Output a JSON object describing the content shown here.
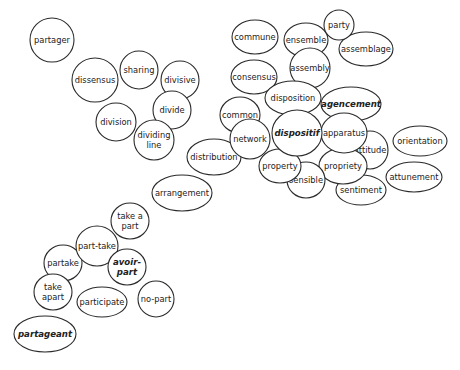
{
  "diagram": {
    "type": "word-bubble-cluster",
    "colors": {
      "stroke": "#2a2a2a",
      "fill": "#ffffff",
      "text": "#222222"
    },
    "nodes": [
      {
        "id": "partager",
        "lines": [
          "partager"
        ],
        "emphasis": false
      },
      {
        "id": "dissensus",
        "lines": [
          "dissensus"
        ],
        "emphasis": false
      },
      {
        "id": "sharing",
        "lines": [
          "sharing"
        ],
        "emphasis": false
      },
      {
        "id": "divisive",
        "lines": [
          "divisive"
        ],
        "emphasis": false
      },
      {
        "id": "divide",
        "lines": [
          "divide"
        ],
        "emphasis": false
      },
      {
        "id": "division",
        "lines": [
          "division"
        ],
        "emphasis": false
      },
      {
        "id": "dividing-line",
        "lines": [
          "dividing",
          "line"
        ],
        "emphasis": false
      },
      {
        "id": "commune",
        "lines": [
          "commune"
        ],
        "emphasis": false
      },
      {
        "id": "consensus",
        "lines": [
          "consensus"
        ],
        "emphasis": false
      },
      {
        "id": "distribution",
        "lines": [
          "distribution"
        ],
        "emphasis": false
      },
      {
        "id": "common",
        "lines": [
          "common"
        ],
        "emphasis": false
      },
      {
        "id": "network",
        "lines": [
          "network"
        ],
        "emphasis": false
      },
      {
        "id": "assemblage",
        "lines": [
          "assemblage"
        ],
        "emphasis": false
      },
      {
        "id": "ensemble",
        "lines": [
          "ensemble"
        ],
        "emphasis": false
      },
      {
        "id": "party",
        "lines": [
          "party"
        ],
        "emphasis": false
      },
      {
        "id": "assembly",
        "lines": [
          "assembly"
        ],
        "emphasis": false
      },
      {
        "id": "agencement",
        "lines": [
          "agencement"
        ],
        "emphasis": true
      },
      {
        "id": "disposition",
        "lines": [
          "disposition"
        ],
        "emphasis": false
      },
      {
        "id": "orientation",
        "lines": [
          "orientation"
        ],
        "emphasis": false
      },
      {
        "id": "attunement",
        "lines": [
          "attunement"
        ],
        "emphasis": false
      },
      {
        "id": "attitude",
        "lines": [
          "attitude"
        ],
        "emphasis": false
      },
      {
        "id": "sentiment",
        "lines": [
          "sentiment"
        ],
        "emphasis": false
      },
      {
        "id": "propriety",
        "lines": [
          "propriety"
        ],
        "emphasis": false
      },
      {
        "id": "apparatus",
        "lines": [
          "apparatus"
        ],
        "emphasis": false
      },
      {
        "id": "sensible",
        "lines": [
          "sensible"
        ],
        "emphasis": false
      },
      {
        "id": "property",
        "lines": [
          "property"
        ],
        "emphasis": false
      },
      {
        "id": "dispositif",
        "lines": [
          "dispositif"
        ],
        "emphasis": true
      },
      {
        "id": "arrangement",
        "lines": [
          "arrangement"
        ],
        "emphasis": false
      },
      {
        "id": "take-a-part",
        "lines": [
          "take a",
          "part"
        ],
        "emphasis": false
      },
      {
        "id": "partake",
        "lines": [
          "partake"
        ],
        "emphasis": false
      },
      {
        "id": "part-take",
        "lines": [
          "part-take"
        ],
        "emphasis": false
      },
      {
        "id": "avoir-part",
        "lines": [
          "avoir-",
          "part"
        ],
        "emphasis": true
      },
      {
        "id": "take-apart",
        "lines": [
          "take",
          "apart"
        ],
        "emphasis": false
      },
      {
        "id": "participate",
        "lines": [
          "participate"
        ],
        "emphasis": false
      },
      {
        "id": "no-part",
        "lines": [
          "no-part"
        ],
        "emphasis": false
      },
      {
        "id": "partageant",
        "lines": [
          "partageant"
        ],
        "emphasis": true
      }
    ]
  }
}
